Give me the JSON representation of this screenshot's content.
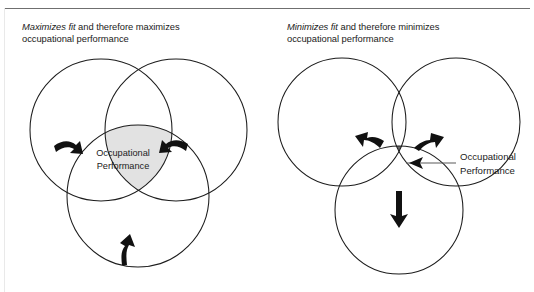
{
  "figure": {
    "panels": [
      {
        "id": "maximizes-fit",
        "caption_emphasis": "Maximizes fit",
        "caption_rest": " and therefore maximizes",
        "caption_line2": "occupational performance",
        "center_label_line1": "Occupational",
        "center_label_line2": "Performance",
        "label_placement": "inside-intersection",
        "overlap": "high",
        "intersection_fill": "#e2e2e2",
        "arrow_direction": "inward",
        "arrows": [
          {
            "name": "arrow-left-inward",
            "points": "right"
          },
          {
            "name": "arrow-right-inward",
            "points": "left"
          },
          {
            "name": "arrow-bottom-inward",
            "points": "up"
          }
        ]
      },
      {
        "id": "minimizes-fit",
        "caption_emphasis": "Minimizes fit",
        "caption_rest": " and therefore minimizes",
        "caption_line2": "occupational performance",
        "center_label_line1": "Occupational",
        "center_label_line2": "Performance",
        "label_placement": "outside-with-leader-line",
        "overlap": "low",
        "intersection_fill": "#6a6a6a",
        "arrow_direction": "outward",
        "arrows": [
          {
            "name": "arrow-left-outward",
            "points": "up-left"
          },
          {
            "name": "arrow-right-outward",
            "points": "up-right"
          },
          {
            "name": "arrow-bottom-outward",
            "points": "down"
          }
        ]
      }
    ],
    "colors": {
      "circle_stroke": "#1c1c1c",
      "rule": "#6f6f6f",
      "arrow": "#111111",
      "shade_light": "#e2e2e2",
      "shade_dark": "#6a6a6a",
      "text": "#1b1b1b"
    }
  }
}
